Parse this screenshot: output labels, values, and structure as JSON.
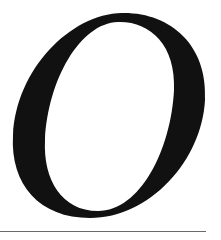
{
  "glyph": {
    "character": "O",
    "style": "italic serif capital",
    "fill_color": "#111111",
    "background_color": "#ffffff"
  },
  "rule": {
    "color": "#6a6a6a"
  }
}
